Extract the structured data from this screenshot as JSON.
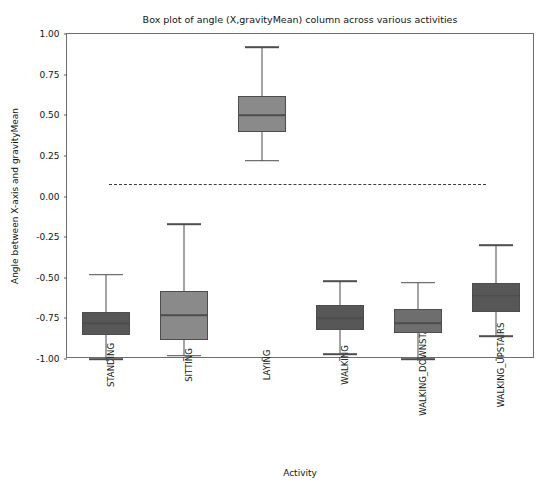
{
  "chart_data": {
    "type": "box",
    "title": "Box plot of angle (X,gravityMean) column across various activities",
    "xlabel": "Activity",
    "ylabel": "Angle between X-axis and gravityMean",
    "ylim": [
      -1.0,
      1.0
    ],
    "yticks": [
      1.0,
      0.75,
      0.5,
      0.25,
      0.0,
      -0.25,
      -0.5,
      -0.75,
      -1.0
    ],
    "ytick_labels": [
      "1.00",
      "0.75",
      "0.50",
      "0.25",
      "0.00",
      "-0.25",
      "-0.50",
      "-0.75",
      "-1.00"
    ],
    "grid": false,
    "legend": null,
    "categories": [
      "STANDING",
      "SITTING",
      "LAYING",
      "WALKING",
      "WALKING_DOWNSTAIRS",
      "WALKING_UPSTAIRS"
    ],
    "boxes": [
      {
        "category": "STANDING",
        "whisker_low": -1.0,
        "q1": -0.85,
        "median": -0.78,
        "q3": -0.71,
        "whisker_high": -0.48,
        "fill_color": "#575757",
        "edge_color": "#4d4d4d"
      },
      {
        "category": "SITTING",
        "whisker_low": -0.98,
        "q1": -0.88,
        "median": -0.73,
        "q3": -0.58,
        "whisker_high": -0.17,
        "fill_color": "#8a8a8a",
        "edge_color": "#4d4d4d"
      },
      {
        "category": "LAYING",
        "whisker_low": 0.22,
        "q1": 0.4,
        "median": 0.5,
        "q3": 0.62,
        "whisker_high": 0.92,
        "fill_color": "#8a8a8a",
        "edge_color": "#4d4d4d"
      },
      {
        "category": "WALKING",
        "whisker_low": -0.97,
        "q1": -0.82,
        "median": -0.75,
        "q3": -0.67,
        "whisker_high": -0.52,
        "fill_color": "#575757",
        "edge_color": "#4d4d4d"
      },
      {
        "category": "WALKING_DOWNSTAIRS",
        "whisker_low": -1.0,
        "q1": -0.84,
        "median": -0.78,
        "q3": -0.69,
        "whisker_high": -0.53,
        "fill_color": "#6e6e6e",
        "edge_color": "#4d4d4d"
      },
      {
        "category": "WALKING_UPSTAIRS",
        "whisker_low": -0.86,
        "q1": -0.71,
        "median": -0.61,
        "q3": -0.53,
        "whisker_high": -0.3,
        "fill_color": "#575757",
        "edge_color": "#4d4d4d"
      }
    ],
    "reference_line": {
      "y": 0.08,
      "style": "dashed",
      "color": "#3d3d3d",
      "x_start_fraction": 0.09,
      "x_end_fraction": 0.895
    }
  }
}
